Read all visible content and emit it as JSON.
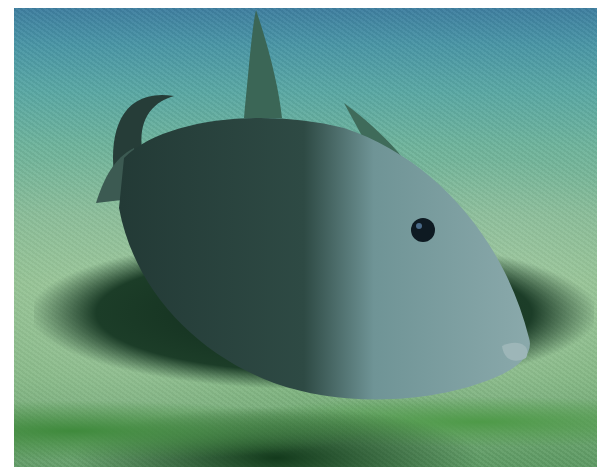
{
  "image": {
    "subject": "grey triggerfish swimming above sandy seabed",
    "scene": "underwater",
    "colors": {
      "water_top": "#3f7fa0",
      "water_mid": "#6fb49c",
      "sand": "#8fc08e",
      "fish_body": "#5f8a8c",
      "fish_dark": "#1f3530",
      "shadow": "#102a1c"
    }
  }
}
